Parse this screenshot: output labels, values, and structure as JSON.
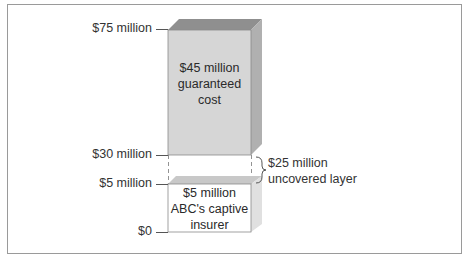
{
  "diagram": {
    "axis_labels": [
      {
        "text": "$75 million",
        "y": 29
      },
      {
        "text": "$30 million",
        "y": 155
      },
      {
        "text": "$5 million",
        "y": 184
      },
      {
        "text": "$0",
        "y": 232
      }
    ],
    "boxes": [
      {
        "name": "guaranteed-cost-layer",
        "lines": [
          "$45 million",
          "guaranteed",
          "cost"
        ],
        "fill": "#d6d6d6",
        "from": 30,
        "to": 75
      },
      {
        "name": "captive-insurer-layer",
        "lines": [
          "$5 million",
          "ABC's captive",
          "insurer"
        ],
        "fill": "#ffffff",
        "from": 0,
        "to": 5
      }
    ],
    "gap": {
      "lines": [
        "$25 million",
        "uncovered layer"
      ],
      "from": 5,
      "to": 30
    },
    "colors": {
      "frame": "#9a9a9a",
      "top_face": "#8f8f8f",
      "side_face": "#b4b4b4",
      "front_shaded": "#d6d6d6",
      "light_side": "#e3e3e3"
    }
  }
}
